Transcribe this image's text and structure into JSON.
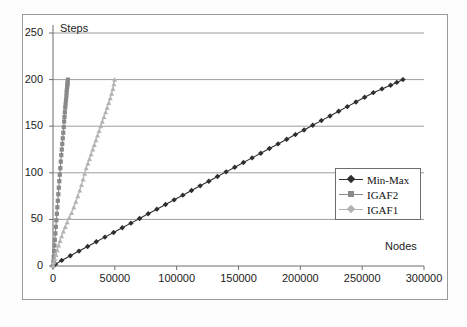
{
  "chart_data": {
    "type": "line",
    "title": "",
    "xlabel": "Nodes",
    "ylabel": "Steps",
    "xlim": [
      0,
      300000
    ],
    "ylim": [
      0,
      250
    ],
    "xticks": [
      "0",
      "50000",
      "100000",
      "150000",
      "200000",
      "250000",
      "300000"
    ],
    "yticks": [
      "0",
      "50",
      "100",
      "150",
      "200",
      "250"
    ],
    "xtick_values": [
      0,
      50000,
      100000,
      150000,
      200000,
      250000,
      300000
    ],
    "ytick_values": [
      0,
      50,
      100,
      150,
      200,
      250
    ],
    "grid": "horizontal",
    "legend_position": "center-right",
    "series": [
      {
        "name": "Min-Max",
        "color": "#2f2f2f",
        "marker": "diamond",
        "x": [
          0,
          2000,
          7000,
          14000,
          21000,
          28000,
          35000,
          42000,
          49000,
          56000,
          63000,
          70000,
          77000,
          84000,
          91000,
          98000,
          105000,
          112000,
          119000,
          126000,
          133000,
          140000,
          147000,
          154000,
          161000,
          168000,
          175000,
          182000,
          189000,
          196000,
          203000,
          210000,
          217000,
          224000,
          231000,
          238000,
          245000,
          252000,
          259000,
          266000,
          273000,
          278000,
          283000
        ],
        "y": [
          0,
          2,
          6,
          11,
          16,
          21,
          26,
          31,
          36,
          41,
          46,
          51,
          56,
          61,
          66,
          71,
          76,
          81,
          86,
          91,
          96,
          101,
          106,
          111,
          116,
          121,
          126,
          131,
          136,
          141,
          146,
          151,
          156,
          161,
          166,
          171,
          176,
          181,
          186,
          190,
          194,
          197,
          200
        ]
      },
      {
        "name": "IGAF2",
        "color": "#8a8a8a",
        "marker": "square",
        "x": [
          0,
          300,
          600,
          900,
          1200,
          1500,
          1900,
          2300,
          2700,
          3100,
          3500,
          3900,
          4300,
          4700,
          5100,
          5500,
          5900,
          6300,
          6700,
          7100,
          7500,
          7900,
          8300,
          8700,
          9000,
          9300,
          9600,
          9900,
          10200,
          10500,
          10800,
          11000,
          11200,
          11400,
          11600,
          11800,
          11900,
          12000
        ],
        "y": [
          0,
          5,
          10,
          16,
          22,
          28,
          35,
          42,
          49,
          56,
          63,
          70,
          77,
          84,
          91,
          98,
          105,
          112,
          119,
          125,
          131,
          137,
          143,
          149,
          155,
          160,
          165,
          170,
          174,
          178,
          182,
          186,
          189,
          192,
          194,
          196,
          198,
          200
        ]
      },
      {
        "name": "IGAF1",
        "color": "#b3b3b3",
        "marker": "triangle",
        "x": [
          0,
          700,
          1500,
          2400,
          3400,
          4500,
          5700,
          7000,
          8400,
          9900,
          11500,
          13200,
          15000,
          16800,
          18500,
          20100,
          21600,
          23000,
          24300,
          25600,
          26900,
          28200,
          29500,
          30800,
          32100,
          33400,
          34700,
          36000,
          37300,
          38600,
          39900,
          41200,
          42500,
          43800,
          45100,
          46300,
          47400,
          48400,
          49200,
          49800
        ],
        "y": [
          0,
          4,
          8,
          12,
          17,
          22,
          27,
          32,
          37,
          42,
          47,
          52,
          57,
          63,
          69,
          75,
          81,
          87,
          93,
          99,
          105,
          110,
          115,
          120,
          125,
          130,
          135,
          140,
          145,
          150,
          155,
          160,
          165,
          170,
          175,
          180,
          185,
          190,
          195,
          200
        ]
      }
    ]
  },
  "legend": {
    "items": [
      {
        "label": "Min-Max"
      },
      {
        "label": "IGAF2"
      },
      {
        "label": "IGAF1"
      }
    ]
  },
  "colors": {
    "min_max": "#2f2f2f",
    "igaf2": "#8a8a8a",
    "igaf1": "#b3b3b3",
    "axis": "#6d6d6d",
    "grid": "#9d9d9d",
    "text": "#1c1c1c"
  }
}
